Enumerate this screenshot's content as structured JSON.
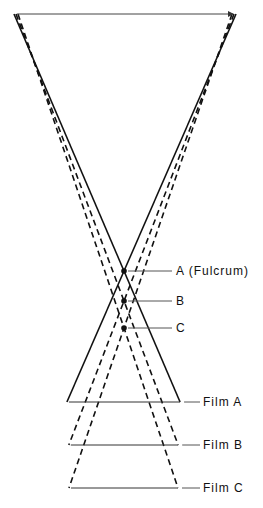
{
  "diagram": {
    "type": "tomography-fulcrum-geometry",
    "colors": {
      "line": "#111111",
      "background": "#ffffff"
    },
    "source": {
      "x1": 14,
      "x2": 236,
      "y": 14
    },
    "points": [
      {
        "id": "A",
        "label": "A  (Fulcrum)",
        "x": 124,
        "y": 271,
        "film_label": "Film  A",
        "film_y": 402,
        "style": "solid"
      },
      {
        "id": "B",
        "label": "B",
        "x": 124,
        "y": 301,
        "film_label": "Film  B",
        "film_y": 445,
        "style": "dashed"
      },
      {
        "id": "C",
        "label": "C",
        "x": 124,
        "y": 328,
        "film_label": "Film  C",
        "film_y": 488,
        "style": "dashed"
      }
    ]
  },
  "labels": {
    "point_a": "A  (Fulcrum)",
    "point_b": "B",
    "point_c": "C",
    "film_a": "Film  A",
    "film_b": "Film  B",
    "film_c": "Film  C"
  }
}
